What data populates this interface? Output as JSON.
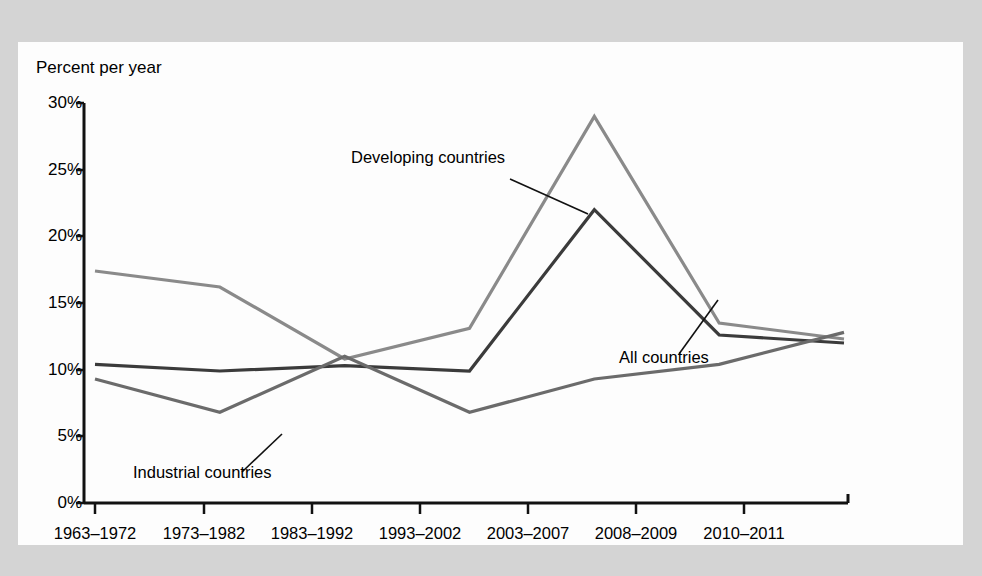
{
  "figure": {
    "y_axis_title": "Percent per year",
    "panel_bg": "#fdfdfd",
    "page_bg": "#d4d4d4"
  },
  "ghost": {
    "text": "Figure 16-3 Growth The ongoing of the world economy has slowed slightly since the mid-1970s. Industrial Growth Source Statistic Bank in the 1963 to 1972 period as that in the of the total but in the 1983 to 1992 period their share has slowed from slower. But is still higher than that of the World which also had a had the rate of growth per the economic have during to 1982, up more of that in the 2003 to 2007 period. In a higher growth rate since their share their growth rate about in per more than that of the world economy on a fairly basis. Meanwhile in the crisis that in 1990s and since then the industrial that the in the international trade and share are in the growth of the world economy. Certain to these can be the more in the relative in the result of the world of the are than than that of developing the to the more have to the economies of developing than that of industrial growth for the world economy."
  },
  "chart_data": {
    "type": "line",
    "title": "",
    "xlabel": "",
    "ylabel": "Percent per year",
    "ylim": [
      0,
      30
    ],
    "yticks": [
      0,
      5,
      10,
      15,
      20,
      25,
      30
    ],
    "ytick_labels": [
      "0%",
      "5%",
      "10%",
      "15%",
      "20%",
      "25%",
      "30%"
    ],
    "grid": false,
    "legend": "inline-annotations",
    "categories": [
      "1963–1972",
      "1973–1982",
      "1983–1992",
      "1993–2002",
      "2003–2007",
      "2008–2009",
      "2010–2011"
    ],
    "series": [
      {
        "name": "Developing countries",
        "color": "#8a8a8a",
        "values": [
          17.4,
          16.2,
          10.8,
          13.1,
          29.0,
          13.5,
          12.3
        ]
      },
      {
        "name": "All countries",
        "color": "#3b3b3b",
        "values": [
          10.4,
          9.9,
          10.3,
          9.9,
          22.0,
          12.6,
          12.0
        ]
      },
      {
        "name": "Industrial countries",
        "color": "#6b6b6b",
        "values": [
          9.3,
          6.8,
          11.0,
          6.8,
          9.3,
          10.4,
          12.8
        ]
      }
    ],
    "annotations": [
      {
        "name": "developing-countries",
        "text": "Developing countries",
        "label_x": 333,
        "label_y": 118,
        "leader": {
          "x1": 492,
          "y1": 137,
          "x2": 570,
          "y2": 172
        }
      },
      {
        "name": "all-countries",
        "text": "All countries",
        "label_x": 601,
        "label_y": 318,
        "leader": {
          "x1": 661,
          "y1": 312,
          "x2": 700,
          "y2": 258
        }
      },
      {
        "name": "industrial-countries",
        "text": "Industrial countries",
        "label_x": 115,
        "label_y": 433,
        "leader": {
          "x1": 224,
          "y1": 430,
          "x2": 264,
          "y2": 392
        }
      }
    ]
  }
}
